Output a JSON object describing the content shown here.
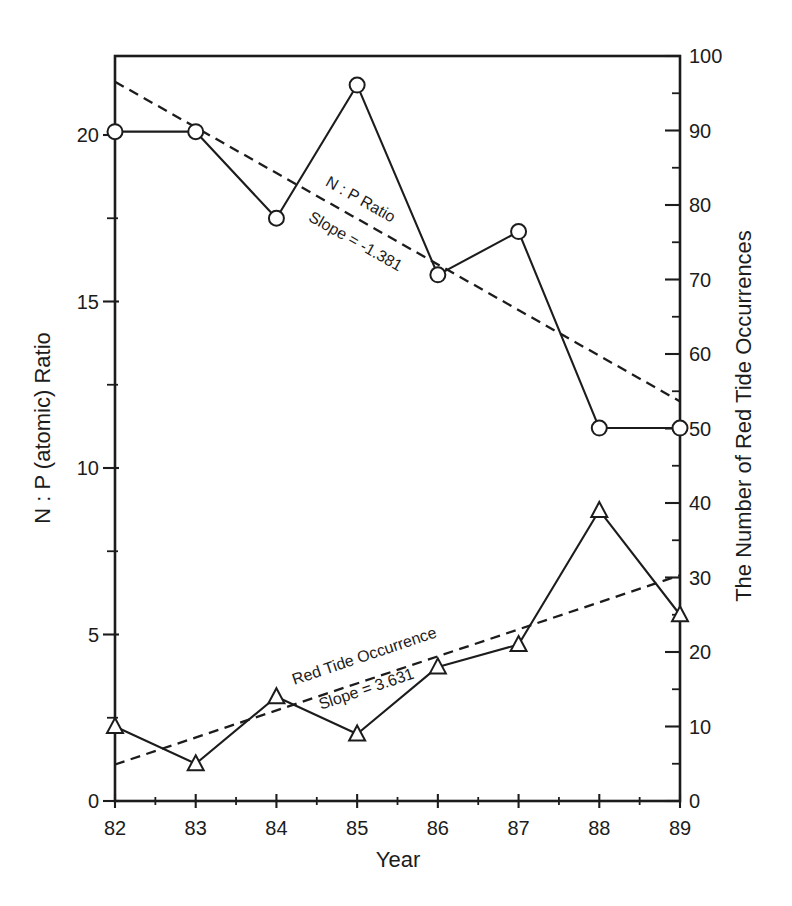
{
  "page": {
    "background": "#ffffff",
    "ink_color": "#1c1c1c"
  },
  "chart_data": {
    "type": "line",
    "title": "",
    "xlabel": "Year",
    "grid": false,
    "x": [
      82,
      83,
      84,
      85,
      86,
      87,
      88,
      89
    ],
    "x_tick_labels": [
      "82",
      "83",
      "84",
      "85",
      "86",
      "87",
      "88",
      "89"
    ],
    "x_minor_ticks": [
      82.5,
      83.5,
      84.5,
      85.5,
      86.5,
      87.5,
      88.5
    ],
    "axes": {
      "left": {
        "label": "N : P (atomic) Ratio",
        "range": [
          0,
          22.4
        ],
        "major_ticks": [
          0,
          5,
          10,
          15,
          20
        ],
        "tick_labels": [
          "0",
          "5",
          "10",
          "15",
          "20"
        ],
        "minor_ticks": [
          2.5,
          7.5,
          12.5,
          17.5
        ]
      },
      "right": {
        "label": "The Number of Red Tide Occurrences",
        "range": [
          0,
          100
        ],
        "major_ticks": [
          0,
          10,
          20,
          30,
          40,
          50,
          60,
          70,
          80,
          90,
          100
        ],
        "tick_labels": [
          "0",
          "10",
          "20",
          "30",
          "40",
          "50",
          "60",
          "70",
          "80",
          "90",
          "100"
        ],
        "minor_ticks": [
          5,
          15,
          25,
          35,
          45,
          55,
          65,
          75,
          85,
          95
        ]
      }
    },
    "series": [
      {
        "name": "N : P Ratio",
        "axis": "left",
        "marker": "circle",
        "line_style": "solid",
        "values": [
          20.1,
          20.1,
          17.5,
          21.5,
          15.8,
          17.1,
          11.2,
          11.2
        ],
        "trend": {
          "label": "N : P Ratio",
          "slope_label": "Slope = -1.381",
          "slope": -1.381,
          "line_style": "dashed",
          "start_value": 21.6,
          "end_value": 12.0
        }
      },
      {
        "name": "Red Tide Occurrence",
        "axis": "right",
        "marker": "triangle",
        "line_style": "solid",
        "values": [
          10,
          5,
          14,
          9,
          18,
          21,
          39,
          25
        ],
        "trend": {
          "label": "Red Tide Occurrence",
          "slope_label": "Slope = 3.631",
          "slope": 3.631,
          "line_style": "dashed",
          "start_value": 4.9,
          "end_value": 30.3
        }
      }
    ]
  }
}
